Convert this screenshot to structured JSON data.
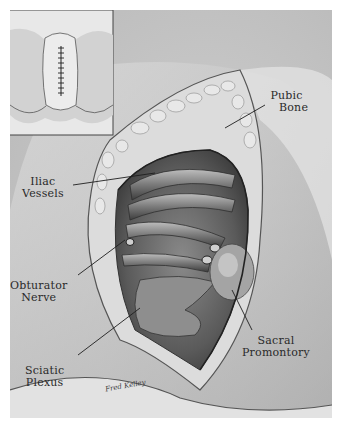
{
  "illustration": {
    "subject": "Pelvic surgical exposure",
    "style": "grayscale pencil drawing",
    "inset": {
      "description": "Sutured midline incision inset",
      "suture_stitches": 10
    },
    "labels": [
      {
        "id": "pubic-bone",
        "line1": "Pubic",
        "line2": "Bone"
      },
      {
        "id": "iliac-vessels",
        "line1": "Iliac",
        "line2": "Vessels"
      },
      {
        "id": "obturator-nerve",
        "line1": "Obturator",
        "line2": "Nerve"
      },
      {
        "id": "sacral-promontory",
        "line1": "Sacral",
        "line2": "Promontory"
      },
      {
        "id": "sciatic-plexus",
        "line1": "Sciatic",
        "line2": "Plexus"
      }
    ],
    "signature": "Fred Kelley",
    "colors": {
      "background": "#ffffff",
      "paper": "#d4d4d4",
      "ink": "#2a2a2a",
      "shadow": "#555555",
      "highlight": "#ececec"
    }
  }
}
